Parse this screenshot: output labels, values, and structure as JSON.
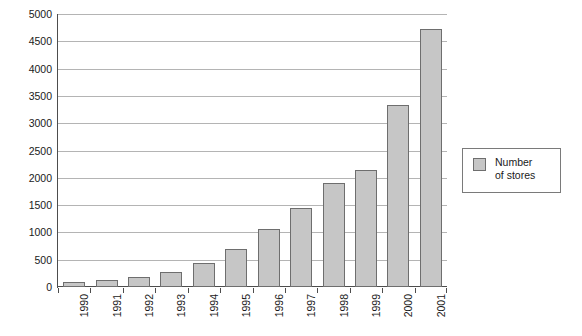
{
  "chart_data": {
    "type": "bar",
    "title": "",
    "subtitle": "",
    "xlabel": "",
    "ylabel": "",
    "categories": [
      "1990",
      "1991",
      "1992",
      "1993",
      "1994",
      "1995",
      "1996",
      "1997",
      "1998",
      "1999",
      "2000",
      "2001"
    ],
    "values": [
      85,
      120,
      175,
      280,
      440,
      690,
      1060,
      1440,
      1910,
      2150,
      3330,
      4720
    ],
    "series": [
      {
        "name": "Number of stores",
        "values": [
          85,
          120,
          175,
          280,
          440,
          690,
          1060,
          1440,
          1910,
          2150,
          3330,
          4720
        ]
      }
    ],
    "ylim": [
      0,
      5000
    ],
    "ytick_labels": [
      "0",
      "500",
      "1000",
      "1500",
      "2000",
      "2500",
      "3000",
      "3500",
      "4000",
      "4500",
      "5000"
    ],
    "ytick_values": [
      0,
      500,
      1000,
      1500,
      2000,
      2500,
      3000,
      3500,
      4000,
      4500,
      5000
    ],
    "grid": true,
    "grid_axis": "y",
    "legend": {
      "position": "right",
      "entries": [
        {
          "label_line1": "Number",
          "label_line2": "of stores",
          "label": "Number of stores",
          "color": "#c6c6c6"
        }
      ]
    },
    "bar_fill_color": "#c6c6c6",
    "bar_border_color": "#6e6e6e",
    "gridline_color": "#b4b4b4",
    "axis_color": "#4d4d4d",
    "background_color": "#ffffff",
    "xtick_label_rotation": 90
  }
}
